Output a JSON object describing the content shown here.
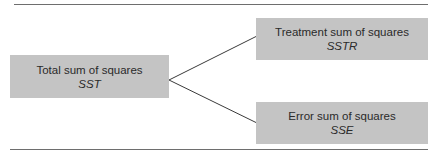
{
  "diagram": {
    "root": {
      "label": "Total sum of squares",
      "symbol": "SST"
    },
    "children": [
      {
        "label": "Treatment sum of squares",
        "symbol": "SSTR"
      },
      {
        "label": "Error sum of squares",
        "symbol": "SSE"
      }
    ],
    "colors": {
      "box_fill": "#c4c4c4",
      "line": "#3a3a3a",
      "rule": "#6e6e6e"
    }
  }
}
